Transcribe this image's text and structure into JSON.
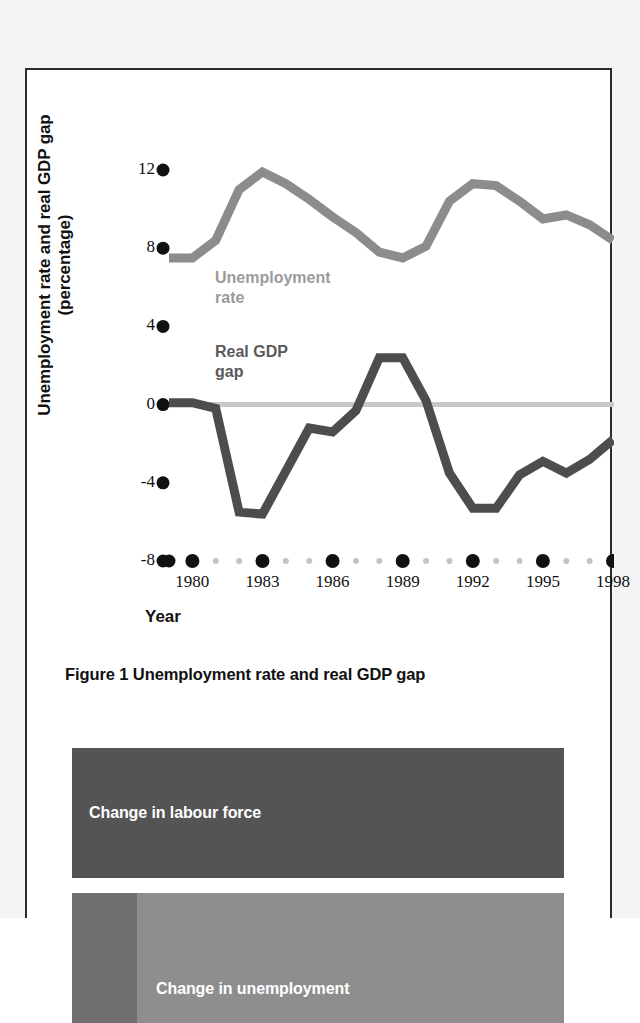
{
  "figure": {
    "caption": "Figure 1 Unemployment rate and real GDP gap",
    "y_axis_title": "Unemployment rate and real GDP gap\n(percentage)",
    "x_axis_title": "Year",
    "series_labels": {
      "unemployment": "Unemployment\nrate",
      "gdp_gap": "Real GDP\ngap"
    }
  },
  "colors": {
    "unemployment_line": "#8c8c8c",
    "gdp_gap_line": "#4d4d4d",
    "zero_line": "#c9c9c9",
    "axis_dot": "#111111",
    "panel_border": "#2b2b2b",
    "bar_labour_force": "#545454",
    "bar_unemployment": "#8e8e8e",
    "bar_unemployment_stub": "#6f6f6f",
    "page_surface": "#f4f4f4"
  },
  "bars": {
    "labour_force_label": "Change in labour force",
    "unemployment_label": "Change in unemployment"
  },
  "chart_data": {
    "type": "line",
    "title": "Figure 1 Unemployment rate and real GDP gap",
    "xlabel": "Year",
    "ylabel": "Unemployment rate and real GDP gap (percentage)",
    "xlim": [
      1979,
      1998
    ],
    "ylim": [
      -8,
      12
    ],
    "yticks": [
      12,
      8,
      4,
      0,
      -4,
      -8
    ],
    "ytick_labels": [
      "12",
      "8",
      "4",
      "0",
      "-4",
      "-8"
    ],
    "xticks": [
      1980,
      1983,
      1986,
      1989,
      1992,
      1995,
      1998
    ],
    "xtick_labels": [
      "1980",
      "1983",
      "1986",
      "1989",
      "1992",
      "1995",
      "1998"
    ],
    "minor_xticks_per_interval": 2,
    "grid": false,
    "legend": "inline-annotations",
    "zero_reference_line": 0,
    "x": [
      1979,
      1980,
      1981,
      1982,
      1983,
      1984,
      1985,
      1986,
      1987,
      1988,
      1989,
      1990,
      1991,
      1992,
      1993,
      1994,
      1995,
      1996,
      1997,
      1998
    ],
    "series": [
      {
        "name": "Unemployment rate",
        "color": "#8c8c8c",
        "values": [
          7.5,
          7.5,
          8.4,
          11.0,
          11.9,
          11.3,
          10.5,
          9.6,
          8.8,
          7.8,
          7.5,
          8.1,
          10.4,
          11.3,
          11.2,
          10.4,
          9.5,
          9.7,
          9.2,
          8.4
        ]
      },
      {
        "name": "Real GDP gap",
        "color": "#4d4d4d",
        "values": [
          0.1,
          0.1,
          -0.2,
          -5.5,
          -5.6,
          -3.4,
          -1.2,
          -1.4,
          -0.3,
          2.4,
          2.4,
          0.2,
          -3.5,
          -5.3,
          -5.3,
          -3.6,
          -2.9,
          -3.5,
          -2.8,
          -1.8
        ]
      }
    ]
  }
}
